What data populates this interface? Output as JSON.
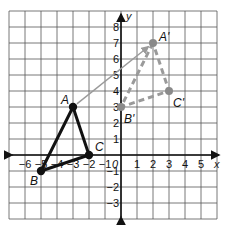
{
  "diagram": {
    "type": "coordinate-plane-translation",
    "axes": {
      "x_label": "x",
      "y_label": "y",
      "origin_label": "0",
      "x_ticks": [
        "-6",
        "-5",
        "-4",
        "-3",
        "-2",
        "-1",
        "1",
        "2",
        "3",
        "4",
        "5"
      ],
      "y_ticks": [
        "8",
        "7",
        "6",
        "5",
        "4",
        "3",
        "2",
        "1",
        "-1",
        "-2",
        "-3"
      ],
      "x_range": [
        -7,
        6
      ],
      "y_range": [
        -4,
        9
      ],
      "grid": true
    },
    "original_triangle": {
      "style": "solid-black",
      "points": [
        {
          "label": "A",
          "x": -3,
          "y": 3
        },
        {
          "label": "B",
          "x": -5,
          "y": -1
        },
        {
          "label": "C",
          "x": -2,
          "y": 0
        }
      ]
    },
    "image_triangle": {
      "style": "dashed-gray",
      "points": [
        {
          "label": "A'",
          "x": 2,
          "y": 7
        },
        {
          "label": "B'",
          "x": 0,
          "y": 3
        },
        {
          "label": "C'",
          "x": 3,
          "y": 4
        }
      ]
    },
    "translation_arrow": {
      "from": "A",
      "to": "A'",
      "color": "#9a9a9a"
    },
    "colors": {
      "grid": "#555555",
      "axis": "#111111",
      "original": "#111111",
      "image": "#9a9a9a",
      "image_point": "#8a8a8a"
    }
  }
}
